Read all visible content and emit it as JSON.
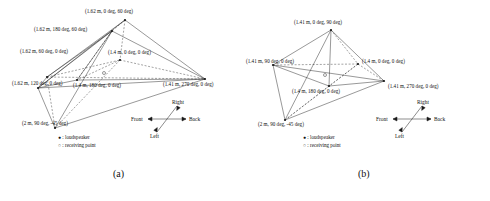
{
  "figure": {
    "panels": [
      {
        "id": "a",
        "caption": "(a)",
        "labels": [
          {
            "name": "vertex-apex",
            "text": "(1.62 m, 0 deg, 60 deg)"
          },
          {
            "name": "vertex-upper-back",
            "text": "(1.62 m, 180 deg, 60 deg)"
          },
          {
            "name": "vertex-left-upper",
            "text": "(1.62 m, 60 deg, 0 deg)"
          },
          {
            "name": "vertex-center-front",
            "text": "(1.4 m, 0 deg, 0 deg)"
          },
          {
            "name": "vertex-left-lower",
            "text": "(1.62 m, 120 deg, 0 deg)"
          },
          {
            "name": "vertex-center-back",
            "text": "(1.4 m, 180 deg, 0 deg)"
          },
          {
            "name": "vertex-right",
            "text": "(1.41 m, 270 deg, 0 deg)"
          },
          {
            "name": "vertex-bottom",
            "text": "(2 m, 90 deg, -45 deg)"
          }
        ],
        "legend": [
          {
            "marker": "filled-dot",
            "text": ": loudspeaker"
          },
          {
            "marker": "hollow-dot",
            "text": ": receiving point"
          }
        ],
        "compass": {
          "up": "Right",
          "left": "Front",
          "right": "Back",
          "down": "Left"
        },
        "receiving_point_marker": "o"
      },
      {
        "id": "b",
        "caption": "(b)",
        "labels": [
          {
            "name": "vertex-apex",
            "text": "(1.41 m, 0 deg, 90 deg)"
          },
          {
            "name": "vertex-left",
            "text": "(1.41 m, 90 deg, 0 deg)"
          },
          {
            "name": "vertex-center-front",
            "text": "(1.4 m, 0 deg, 0 deg)"
          },
          {
            "name": "vertex-right",
            "text": "(1.41 m, 270 deg, 0 deg)"
          },
          {
            "name": "vertex-center-back",
            "text": "(1.4 m, 180 deg, 0 deg)"
          },
          {
            "name": "vertex-bottom",
            "text": "(2 m, 90 deg, -45 deg)"
          }
        ],
        "legend": [
          {
            "marker": "filled-dot",
            "text": ": loudspeaker"
          },
          {
            "marker": "hollow-dot",
            "text": ": receiving point"
          }
        ],
        "compass": {
          "up": "Right",
          "left": "Front",
          "right": "Back",
          "down": "Left"
        },
        "receiving_point_marker": "o"
      }
    ],
    "colors": {
      "line": "#1a1a1a",
      "text": "#111111",
      "background": "#ffffff"
    }
  }
}
